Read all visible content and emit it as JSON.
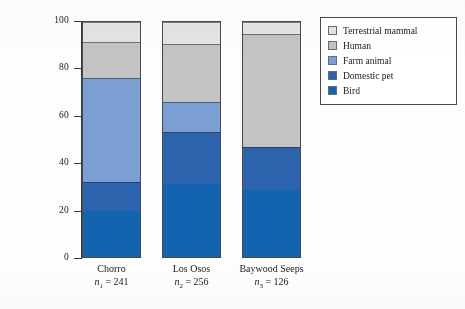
{
  "chart_data": {
    "type": "bar",
    "stacked": true,
    "normalized": true,
    "title": "",
    "xlabel": "",
    "ylabel": "Percentage",
    "ylim": [
      0,
      100
    ],
    "yticks": [
      0,
      20,
      40,
      60,
      80,
      100
    ],
    "ytick_labels": [
      "0",
      "20",
      "40",
      "60",
      "80",
      "100"
    ],
    "grid": false,
    "legend_position": "right",
    "categories": [
      "Chorro",
      "Los Osos",
      "Baywood Seeps"
    ],
    "category_sublabels": [
      "n1 = 241",
      "n2 = 256",
      "n3 = 126"
    ],
    "sample_sizes": [
      241,
      256,
      126
    ],
    "series": [
      {
        "name": "Bird",
        "values": [
          19.5,
          31.0,
          28.5
        ],
        "color": "#1264b0"
      },
      {
        "name": "Domestic pet",
        "values": [
          12.5,
          22.0,
          18.5
        ],
        "color": "#2c63ad"
      },
      {
        "name": "Farm animal",
        "values": [
          44.0,
          12.8,
          0.0
        ],
        "color": "#7b9ed4"
      },
      {
        "name": "Human",
        "values": [
          15.5,
          25.0,
          48.0
        ],
        "color": "#c2c4c3"
      },
      {
        "name": "Terrestrial mammal",
        "values": [
          8.5,
          9.2,
          5.0
        ],
        "color": "#e2e4e3"
      }
    ],
    "legend_order": [
      "Terrestrial mammal",
      "Human",
      "Farm animal",
      "Domestic pet",
      "Bird"
    ]
  },
  "axis": {
    "y_title": "Percentage"
  },
  "categories": [
    {
      "name": "Chorro",
      "n_prefix": "n",
      "n_sub": "1",
      "n_eq": " = ",
      "n_value": "241"
    },
    {
      "name": "Los Osos",
      "n_prefix": "n",
      "n_sub": "2",
      "n_eq": " = ",
      "n_value": "256"
    },
    {
      "name": "Baywood Seeps",
      "n_prefix": "n",
      "n_sub": "3",
      "n_eq": " = ",
      "n_value": "126"
    }
  ],
  "legend": {
    "items": [
      {
        "label": "Terrestrial mammal",
        "color": "#e2e4e3"
      },
      {
        "label": "Human",
        "color": "#c2c4c3"
      },
      {
        "label": "Farm animal",
        "color": "#7b9ed4"
      },
      {
        "label": "Domestic pet",
        "color": "#2c63ad"
      },
      {
        "label": "Bird",
        "color": "#1264b0"
      }
    ]
  }
}
